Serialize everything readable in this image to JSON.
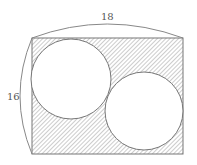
{
  "figure": {
    "width_label": "18",
    "height_label": "16",
    "shape": "rectangle with two inscribed circles, shaded remainder",
    "colors": {
      "stroke": "#777777",
      "hatch": "#9a9a9a",
      "background": "#ffffff"
    }
  }
}
